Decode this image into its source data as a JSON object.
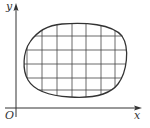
{
  "diagram": {
    "type": "region-partition",
    "axes": {
      "x_label": "x",
      "y_label": "y",
      "origin_label": "O"
    },
    "grid": {
      "vertical_lines_x": [
        27,
        42,
        57,
        72,
        86,
        101,
        115
      ],
      "horizontal_lines_y": [
        36,
        50,
        64,
        78,
        90
      ]
    },
    "colors": {
      "stroke": "#333333",
      "background": "#ffffff"
    }
  }
}
